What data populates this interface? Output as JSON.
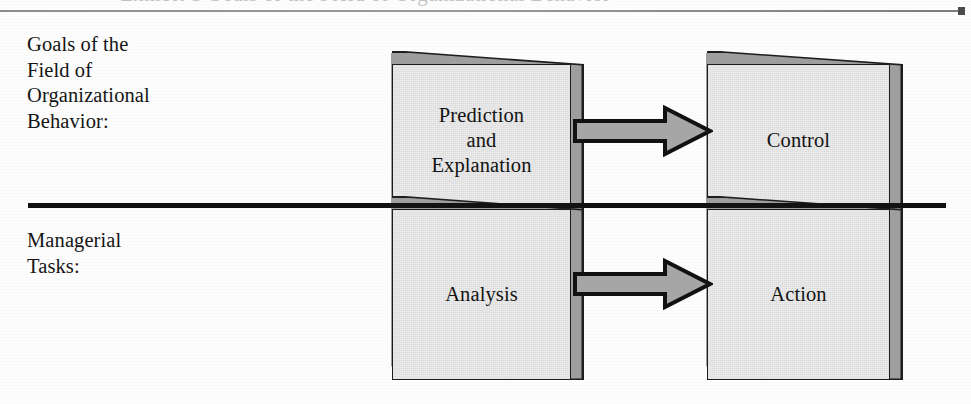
{
  "figure": {
    "type": "flow-diagram",
    "background_color": "#fdfdfd",
    "top_rule": {
      "name": "header-rule",
      "color": "#8d8d8d",
      "end_marker": "square-dot"
    },
    "cropped_heading_remnant": "Exhibit 1 Goals of the Field of Organizational Behavior",
    "divider": {
      "name": "middle-divider",
      "color": "#121212"
    },
    "row_labels": [
      {
        "id": "goals",
        "text": "Goals of the\nField of\nOrganizational\nBehavior:"
      },
      {
        "id": "tasks",
        "text": "Managerial\nTasks:"
      }
    ],
    "boxes": [
      {
        "id": "prediction-explanation",
        "row": "goals",
        "column": "left",
        "label": "Prediction\nand\nExplanation",
        "fill_color": "#ececec",
        "outline_color": "#1d1d1d",
        "shadow_color": "#9e9e9e"
      },
      {
        "id": "control",
        "row": "goals",
        "column": "right",
        "label": "Control",
        "fill_color": "#ececec",
        "outline_color": "#1d1d1d",
        "shadow_color": "#9e9e9e"
      },
      {
        "id": "analysis",
        "row": "tasks",
        "column": "left",
        "label": "Analysis",
        "fill_color": "#ececec",
        "outline_color": "#1d1d1d",
        "shadow_color": "#9e9e9e"
      },
      {
        "id": "action",
        "row": "tasks",
        "column": "right",
        "label": "Action",
        "fill_color": "#ececec",
        "outline_color": "#1d1d1d",
        "shadow_color": "#9e9e9e"
      }
    ],
    "arrows": [
      {
        "id": "arrow-prediction-to-control",
        "from": "prediction-explanation",
        "to": "control",
        "direction": "right",
        "fill_color": "#a6a6a6",
        "outline_color": "#111111"
      },
      {
        "id": "arrow-analysis-to-action",
        "from": "analysis",
        "to": "action",
        "direction": "right",
        "fill_color": "#a6a6a6",
        "outline_color": "#111111"
      }
    ]
  }
}
